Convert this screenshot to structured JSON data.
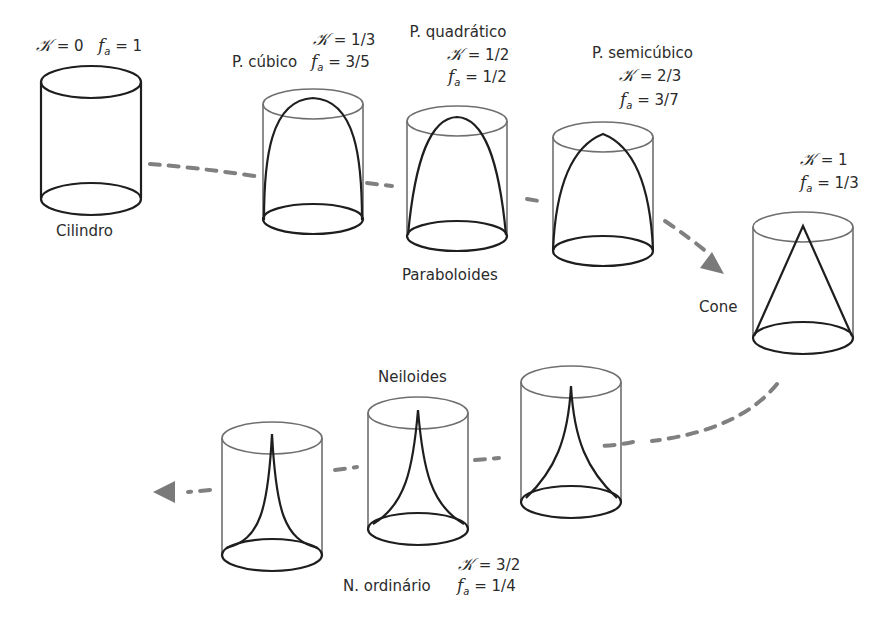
{
  "diagram": {
    "type": "shape-progression",
    "colors": {
      "outline_dark": "#1e1e1e",
      "outline_light": "#6f6f6f",
      "dash": "#808080"
    },
    "symbols": {
      "k": "𝒦",
      "f": "f",
      "f_sub": "a",
      "eq": " = "
    },
    "shapes": [
      {
        "id": "cilindro",
        "name": "Cilindro",
        "k": "0",
        "fa": "1"
      },
      {
        "id": "p-cubico",
        "name": "P. cúbico",
        "k": "1/3",
        "fa": "3/5"
      },
      {
        "id": "p-quadratico",
        "name": "P. quadrático",
        "k": "1/2",
        "fa": "1/2"
      },
      {
        "id": "p-semicubico",
        "name": "P. semicúbico",
        "k": "2/3",
        "fa": "3/7"
      },
      {
        "id": "cone",
        "name": "Cone",
        "k": "1",
        "fa": "1/3"
      },
      {
        "id": "n-ordinario",
        "name": "N. ordinário",
        "k": "3/2",
        "fa": "1/4"
      }
    ],
    "group_labels": {
      "paraboloides": "Paraboloides",
      "neiloides": "Neiloides"
    }
  }
}
